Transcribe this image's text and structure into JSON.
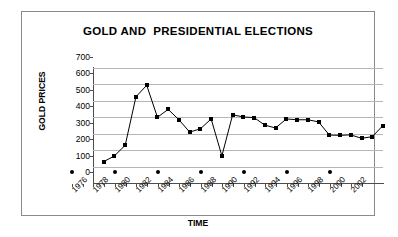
{
  "chart_data": {
    "type": "line",
    "title": "GOLD AND  PRESIDENTIAL ELECTIONS",
    "xlabel": "TIME",
    "ylabel": "GOLD PRICES",
    "ylim": [
      0,
      700
    ],
    "ytick_values": [
      0,
      100,
      200,
      300,
      400,
      500,
      600,
      700
    ],
    "ytick_labels": [
      "0",
      "100",
      "200",
      "300",
      "400",
      "500",
      "600",
      "700"
    ],
    "xlim": [
      1976,
      2003
    ],
    "xtick_values": [
      1976,
      1978,
      1980,
      1982,
      1984,
      1986,
      1988,
      1990,
      1992,
      1994,
      1996,
      1998,
      2000,
      2002
    ],
    "xtick_labels": [
      "1976",
      "1978",
      "1980",
      "1982",
      "1984",
      "1986",
      "1988",
      "1990",
      "1992",
      "1994",
      "1996",
      "1998",
      "2000",
      "2002"
    ],
    "grid": "horizontal",
    "legend": "none",
    "series": [
      {
        "name": "GOLD PRICES",
        "marker": "square",
        "color": "#000000",
        "x": [
          1977,
          1978,
          1979,
          1980,
          1981,
          1982,
          1983,
          1984,
          1985,
          1986,
          1987,
          1988,
          1989,
          1990,
          1991,
          1992,
          1993,
          1994,
          1995,
          1996,
          1997,
          1998,
          1999,
          2000,
          2001,
          2002,
          2003
        ],
        "values": [
          130,
          165,
          230,
          525,
          595,
          400,
          448,
          385,
          310,
          330,
          390,
          165,
          415,
          402,
          398,
          352,
          335,
          390,
          385,
          385,
          372,
          292,
          290,
          293,
          272,
          282,
          350
        ]
      },
      {
        "name": "PRESIDENTIAL ELECTION YEARS",
        "marker": "circle",
        "color": "#000000",
        "x": [
          1976,
          1980,
          1984,
          1988,
          1992,
          1996,
          2000
        ],
        "values": [
          0,
          0,
          0,
          0,
          0,
          0,
          0
        ]
      }
    ]
  },
  "colors": {
    "frame": "#8a8a8a",
    "axis": "#4d4d4d",
    "gridline": "#b5b5b5",
    "series": "#000000",
    "background": "#ffffff"
  }
}
